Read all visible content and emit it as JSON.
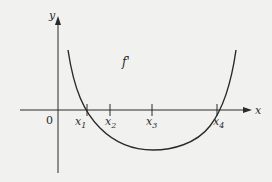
{
  "diagram": {
    "curve_label": "f'",
    "axes": {
      "x_label": "x",
      "y_label": "y",
      "origin_label": "0"
    },
    "ticks": [
      {
        "main": "x",
        "sub": "1"
      },
      {
        "main": "x",
        "sub": "2"
      },
      {
        "main": "x",
        "sub": "3"
      },
      {
        "main": "x",
        "sub": "4"
      }
    ],
    "colors": {
      "background": "#f1f1f0",
      "ink": "#2a2a2a"
    }
  }
}
